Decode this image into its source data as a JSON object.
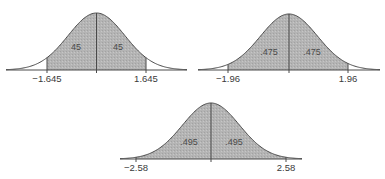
{
  "colors": {
    "shade": "#b4b4b4",
    "line": "#4a4a4a",
    "background": "#ffffff"
  },
  "chart_data": [
    {
      "type": "area",
      "title": "",
      "description": "Standard normal curve, central shaded region",
      "x_range": [
        -3.2,
        3.2
      ],
      "cutoffs": [
        -1.645,
        1.645
      ],
      "tick_labels": [
        "−1.645",
        "1.645"
      ],
      "area_labels": [
        "45",
        "45"
      ],
      "areas": [
        0.45,
        0.45
      ]
    },
    {
      "type": "area",
      "title": "",
      "description": "Standard normal curve, central shaded region",
      "x_range": [
        -3.2,
        3.2
      ],
      "cutoffs": [
        -1.96,
        1.96
      ],
      "tick_labels": [
        "−1.96",
        "1.96"
      ],
      "area_labels": [
        ".475",
        ".475"
      ],
      "areas": [
        0.475,
        0.475
      ]
    },
    {
      "type": "area",
      "title": "",
      "description": "Standard normal curve, central shaded region",
      "x_range": [
        -3.2,
        3.2
      ],
      "cutoffs": [
        -2.58,
        2.58
      ],
      "tick_labels": [
        "−2.58",
        "2.58"
      ],
      "area_labels": [
        ".495",
        ".495"
      ],
      "areas": [
        0.495,
        0.495
      ]
    }
  ],
  "curves": [
    {
      "left": 6,
      "right": 187,
      "base_y": 70,
      "peak_y": 13,
      "cut_left_x": 47,
      "cut_right_x": 146,
      "label_y": 82,
      "area_label_y": 50,
      "area_label_left_x": 76,
      "area_label_right_x": 118
    },
    {
      "left": 198,
      "right": 380,
      "base_y": 70,
      "peak_y": 14,
      "cut_left_x": 228,
      "cut_right_x": 348,
      "label_y": 82,
      "area_label_y": 55,
      "area_label_left_x": 269,
      "area_label_right_x": 312
    },
    {
      "left": 120,
      "right": 302,
      "base_y": 159,
      "peak_y": 103,
      "cut_left_x": 136,
      "cut_right_x": 286,
      "label_y": 171,
      "area_label_y": 145,
      "area_label_left_x": 189,
      "area_label_right_x": 234
    }
  ]
}
